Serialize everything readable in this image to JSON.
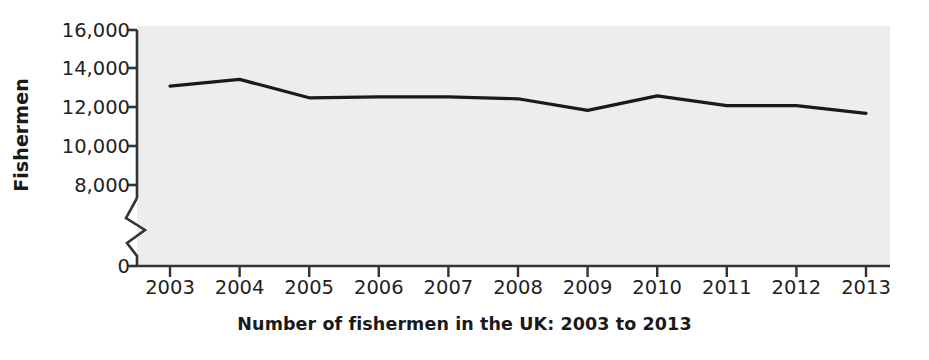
{
  "chart_data": {
    "type": "line",
    "title": "Number of fishermen in the UK: 2003 to 2013",
    "xlabel": "",
    "ylabel": "Fishermen",
    "categories": [
      "2003",
      "2004",
      "2005",
      "2006",
      "2007",
      "2008",
      "2009",
      "2010",
      "2011",
      "2012",
      "2013"
    ],
    "x": [
      2003,
      2004,
      2005,
      2006,
      2007,
      2008,
      2009,
      2010,
      2011,
      2012,
      2013
    ],
    "values": [
      13100,
      13450,
      12500,
      12550,
      12550,
      12450,
      11850,
      12600,
      12100,
      12100,
      11700
    ],
    "series": [
      {
        "name": "Fishermen",
        "values": [
          13100,
          13450,
          12500,
          12550,
          12550,
          12450,
          11850,
          12600,
          12100,
          12100,
          11700
        ],
        "color": "#1a1a1a"
      }
    ],
    "ylim": [
      0,
      16000
    ],
    "y_ticks": [
      0,
      8000,
      10000,
      12000,
      14000,
      16000
    ],
    "y_tick_labels": [
      "0",
      "8,000",
      "10,000",
      "12,000",
      "14,000",
      "16,000"
    ],
    "axis_break": true,
    "axis_break_between": [
      0,
      8000
    ],
    "grid": false,
    "legend": "none",
    "plot_background": "#ededed",
    "axis_color": "#333333",
    "line_color": "#1a1a1a",
    "line_width": 3.2
  },
  "axes": {
    "y_title": "Fishermen",
    "y_tick_labels": [
      "16,000",
      "14,000",
      "12,000",
      "10,000",
      "8,000",
      "0"
    ],
    "x_tick_labels": [
      "2003",
      "2004",
      "2005",
      "2006",
      "2007",
      "2008",
      "2009",
      "2010",
      "2011",
      "2012",
      "2013"
    ]
  },
  "caption": {
    "text": "Number of fishermen in the UK: 2003 to 2013"
  }
}
